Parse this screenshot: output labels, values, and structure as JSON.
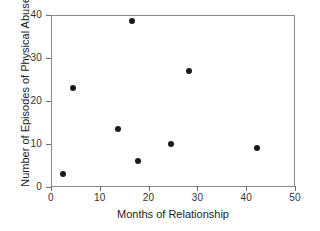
{
  "chart_data": {
    "type": "scatter",
    "title": "",
    "xlabel": "Months of Relationship",
    "ylabel": "Number of Episodes of Physical Abuse",
    "xlim": [
      0,
      50
    ],
    "ylim": [
      0,
      40
    ],
    "xticks": [
      0,
      10,
      20,
      30,
      40,
      50
    ],
    "yticks": [
      0,
      10,
      20,
      30,
      40
    ],
    "xticklabels": [
      "0",
      "10",
      "20",
      "30",
      "40",
      "50"
    ],
    "yticklabels": [
      "0",
      "10",
      "20",
      "30",
      "40"
    ],
    "grid": false,
    "legend": null,
    "marker": "filled-circle",
    "marker_color": "#1a1a1a",
    "points": [
      {
        "x": 2.5,
        "y": 3
      },
      {
        "x": 4.5,
        "y": 23
      },
      {
        "x": 13.8,
        "y": 13.5
      },
      {
        "x": 16.5,
        "y": 38.5
      },
      {
        "x": 17.8,
        "y": 6
      },
      {
        "x": 24.5,
        "y": 10
      },
      {
        "x": 28.3,
        "y": 27
      },
      {
        "x": 42.2,
        "y": 9
      }
    ]
  },
  "figure": {
    "background_color": "#ffffff",
    "frame_color": "#8a8a8a",
    "text_color": "#222222"
  }
}
